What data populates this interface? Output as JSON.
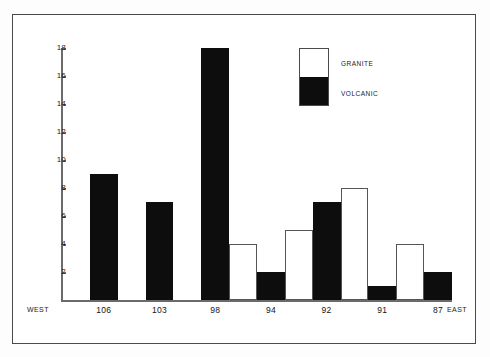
{
  "chart_data": {
    "type": "bar",
    "title": "",
    "xlabel": "",
    "ylabel": "",
    "ylim": [
      0,
      18
    ],
    "grid": false,
    "legend_position": "upper-right",
    "yticks": [
      18,
      16,
      14,
      12,
      10,
      8,
      6,
      4,
      2
    ],
    "axis_end_labels": {
      "left": "WEST",
      "right": "EAST"
    },
    "categories": [
      "106",
      "103",
      "98",
      "94",
      "92",
      "91",
      "87"
    ],
    "series": [
      {
        "name": "VOLCANIC",
        "color": "#0d0d0d",
        "values": [
          9,
          7,
          18,
          2,
          7,
          1,
          2
        ]
      },
      {
        "name": "GRANITE",
        "color": "#ffffff",
        "values": [
          null,
          null,
          4,
          5,
          8,
          4,
          null
        ]
      }
    ],
    "bars": [
      {
        "label": "106",
        "value": 9,
        "kind": "volcanic",
        "slot": 1
      },
      {
        "label": "103",
        "value": 7,
        "kind": "volcanic",
        "slot": 3
      },
      {
        "label": "98",
        "value": 18,
        "kind": "volcanic",
        "slot": 5
      },
      {
        "label": "",
        "value": 4,
        "kind": "granite",
        "slot": 6
      },
      {
        "label": "94",
        "value": 2,
        "kind": "volcanic",
        "slot": 7
      },
      {
        "label": "",
        "value": 5,
        "kind": "granite",
        "slot": 8
      },
      {
        "label": "92",
        "value": 7,
        "kind": "volcanic",
        "slot": 9
      },
      {
        "label": "",
        "value": 8,
        "kind": "granite",
        "slot": 10
      },
      {
        "label": "91",
        "value": 1,
        "kind": "volcanic",
        "slot": 11
      },
      {
        "label": "",
        "value": 4,
        "kind": "granite",
        "slot": 12
      },
      {
        "label": "87",
        "value": 2,
        "kind": "volcanic",
        "slot": 13
      }
    ]
  },
  "axis": {
    "ticks": [
      "18",
      "16",
      "14",
      "12",
      "10",
      "8",
      "6",
      "4",
      "2"
    ],
    "x_categories": [
      "106",
      "103",
      "98",
      "94",
      "92",
      "91",
      "87"
    ],
    "west": "WEST",
    "east": "EAST"
  },
  "legend": {
    "granite_label": "GRANITE",
    "volcanic_label": "VOLCANIC",
    "granite_color": "#ffffff",
    "volcanic_color": "#0d0d0d"
  }
}
